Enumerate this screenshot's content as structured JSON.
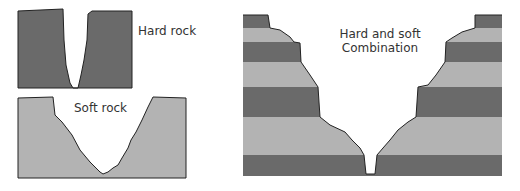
{
  "diagram": {
    "colors": {
      "hard": "#6a6a6a",
      "soft": "#b3b3b3",
      "outline": "#222222",
      "background": "#ffffff"
    },
    "panels": [
      {
        "id": "hard-rock",
        "label": "Hard rock",
        "description": "Narrow, steep-sided V-shaped gorge cut in uniform hard rock"
      },
      {
        "id": "soft-rock",
        "label": "Soft rock",
        "description": "Wide, gently sloping V-shaped valley cut in soft rock"
      },
      {
        "id": "combination",
        "label_line1": "Hard and soft",
        "label_line2": "Combination",
        "description": "Stepped valley sides in alternating hard (dark) and soft (light) horizontal layers"
      }
    ],
    "layers": [
      "hard",
      "soft",
      "hard",
      "soft",
      "hard",
      "soft",
      "hard"
    ]
  }
}
